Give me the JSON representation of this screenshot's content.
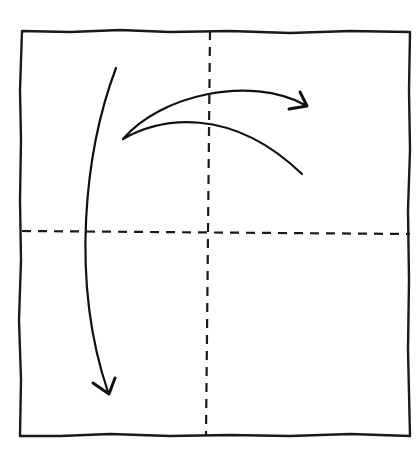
{
  "diagram": {
    "type": "origami-fold-instruction",
    "colors": {
      "ink": "#111111",
      "paper": "#ffffff"
    },
    "paper_square": {
      "x": 22,
      "y": 31,
      "width": 388,
      "height": 405
    },
    "fold_lines": [
      {
        "name": "vertical-valley-fold",
        "style": "dashed",
        "from": [
          210,
          31
        ],
        "to": [
          206,
          436
        ]
      },
      {
        "name": "horizontal-valley-fold",
        "style": "dashed",
        "from": [
          22,
          231
        ],
        "to": [
          410,
          234
        ]
      }
    ],
    "arrows": [
      {
        "name": "fold-down-arrow",
        "direction": "down",
        "from": [
          116,
          68
        ],
        "to": [
          108,
          395
        ]
      },
      {
        "name": "fold-right-arrow",
        "direction": "right",
        "from": [
          123,
          139
        ],
        "to": [
          306,
          105
        ]
      },
      {
        "name": "unfold-curve",
        "direction": "right-down",
        "from": [
          123,
          139
        ],
        "to": [
          302,
          174
        ]
      }
    ]
  }
}
